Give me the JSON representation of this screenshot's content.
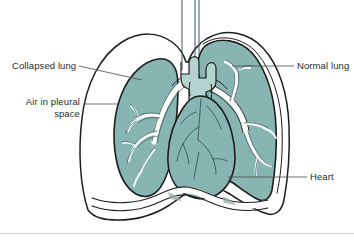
{
  "figure": {
    "labels": {
      "collapsed_lung": "Collapsed lung",
      "air_in_pleural_space": "Air in pleural\nspace",
      "normal_lung": "Normal lung",
      "heart": "Heart"
    },
    "colors": {
      "lung_fill": "#86b5b2",
      "lung_fill_shadow": "#76a8a5",
      "organ_outline": "#1d1d1d",
      "airway_fill": "#ffffff",
      "vessel_line": "#3d5a63",
      "background": "#ffffff",
      "leader_line": "#4a4a4a",
      "text": "#2b2b2b",
      "bottom_rule": "#b9d4d6"
    },
    "structures": [
      "chest-wall",
      "diaphragm",
      "trachea",
      "left-main-bronchus",
      "right-main-bronchus",
      "collapsed-left-lung",
      "normal-right-lung",
      "pleural-air-space",
      "heart",
      "coronary-vessels"
    ]
  }
}
